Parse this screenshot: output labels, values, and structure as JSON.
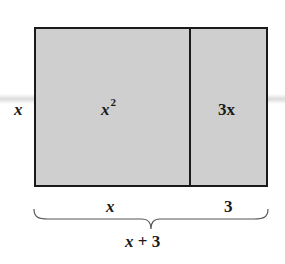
{
  "diagram": {
    "regions": [
      {
        "id": "square",
        "area_label": "x",
        "area_exponent": "2",
        "width_label": "x"
      },
      {
        "id": "strip",
        "area_label": "3x",
        "width_label": "3"
      }
    ],
    "side_label": "x",
    "bottom_labels": {
      "left": "x",
      "right": "3"
    },
    "total_label": {
      "var": "x",
      "op": " + ",
      "num": "3"
    },
    "colors": {
      "fill": "#cfcfcf",
      "stroke": "#1a1a1a",
      "background": "#ffffff"
    }
  }
}
